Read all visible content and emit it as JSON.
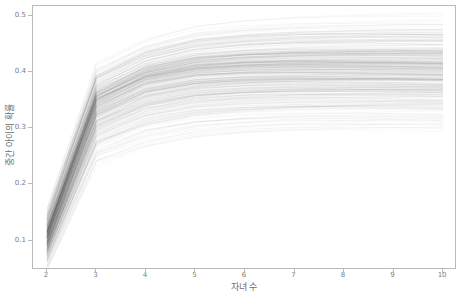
{
  "chart_data": {
    "type": "line",
    "title": "",
    "xlabel": "자녀 수",
    "ylabel": "중간 아이의 확률",
    "xlim": [
      1.72,
      10.28
    ],
    "ylim": [
      0.048,
      0.517
    ],
    "xticks": [
      2,
      3,
      4,
      5,
      6,
      7,
      8,
      9,
      10
    ],
    "xtick_labels": [
      "2",
      "3",
      "4",
      "5",
      "6",
      "7",
      "8",
      "9",
      "10"
    ],
    "yticks": [
      0.1,
      0.2,
      0.3,
      0.4,
      0.5
    ],
    "ytick_labels": [
      "0.1",
      "0.2",
      "0.3",
      "0.4",
      "0.5"
    ],
    "grid": false,
    "legend": null,
    "style": "spaghetti-overlay",
    "line_color": "#2b2b2b",
    "line_opacity": 0.05,
    "line_width": 0.6,
    "n_series": 400,
    "x": [
      2,
      3,
      4,
      5,
      6,
      7,
      8,
      9,
      10
    ],
    "band_summary": {
      "note": "Many overlapping simulated curves; envelope of the bundle at each x.",
      "min": [
        0.055,
        0.232,
        0.262,
        0.278,
        0.285,
        0.29,
        0.292,
        0.293,
        0.293
      ],
      "q25": [
        0.085,
        0.305,
        0.345,
        0.358,
        0.362,
        0.364,
        0.364,
        0.364,
        0.363
      ],
      "median": [
        0.103,
        0.34,
        0.382,
        0.397,
        0.402,
        0.404,
        0.404,
        0.404,
        0.403
      ],
      "q75": [
        0.12,
        0.372,
        0.412,
        0.427,
        0.432,
        0.434,
        0.434,
        0.434,
        0.433
      ],
      "max": [
        0.148,
        0.412,
        0.455,
        0.478,
        0.487,
        0.492,
        0.494,
        0.495,
        0.495
      ]
    },
    "series": [
      {
        "name": "curve-low",
        "values": [
          0.058,
          0.24,
          0.272,
          0.288,
          0.294,
          0.298,
          0.3,
          0.301,
          0.301
        ]
      },
      {
        "name": "curve-q25",
        "values": [
          0.086,
          0.306,
          0.346,
          0.359,
          0.363,
          0.365,
          0.365,
          0.365,
          0.364
        ]
      },
      {
        "name": "curve-mid",
        "values": [
          0.104,
          0.341,
          0.383,
          0.398,
          0.403,
          0.405,
          0.405,
          0.405,
          0.404
        ]
      },
      {
        "name": "curve-q75",
        "values": [
          0.121,
          0.373,
          0.413,
          0.428,
          0.433,
          0.435,
          0.435,
          0.435,
          0.434
        ]
      },
      {
        "name": "curve-high",
        "values": [
          0.146,
          0.41,
          0.452,
          0.475,
          0.484,
          0.489,
          0.491,
          0.492,
          0.492
        ]
      }
    ]
  }
}
